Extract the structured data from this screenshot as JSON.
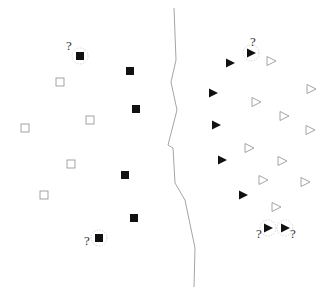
{
  "diagram": {
    "type": "classification-boundary-illustration",
    "colors": {
      "filled": "#111111",
      "hollow_stroke": "#9a9a9a",
      "boundary": "#9a9a9a",
      "query_ring": "#cfcfcf",
      "question": "#333333"
    },
    "boundary": {
      "points": [
        [
          174,
          8
        ],
        [
          176,
          60
        ],
        [
          171,
          82
        ],
        [
          177,
          110
        ],
        [
          168,
          145
        ],
        [
          173,
          148
        ],
        [
          175,
          183
        ],
        [
          185,
          200
        ],
        [
          195,
          248
        ],
        [
          194,
          287
        ]
      ]
    },
    "left_class": {
      "shape": "square",
      "filled": [
        {
          "x": 80,
          "y": 56,
          "query": true,
          "label": "?",
          "label_x": 66,
          "label_y": 50
        },
        {
          "x": 130,
          "y": 71
        },
        {
          "x": 136,
          "y": 109
        },
        {
          "x": 125,
          "y": 175
        },
        {
          "x": 134,
          "y": 218
        },
        {
          "x": 99,
          "y": 238,
          "query": true,
          "label": "?",
          "label_x": 84,
          "label_y": 245
        }
      ],
      "hollow": [
        {
          "x": 60,
          "y": 82
        },
        {
          "x": 90,
          "y": 120
        },
        {
          "x": 25,
          "y": 128
        },
        {
          "x": 71,
          "y": 164
        },
        {
          "x": 44,
          "y": 195
        }
      ]
    },
    "right_class": {
      "shape": "triangle-right",
      "filled": [
        {
          "x": 251,
          "y": 53,
          "query": true,
          "label": "?",
          "label_x": 250,
          "label_y": 46
        },
        {
          "x": 230,
          "y": 63
        },
        {
          "x": 213,
          "y": 93
        },
        {
          "x": 216,
          "y": 125
        },
        {
          "x": 222,
          "y": 160
        },
        {
          "x": 243,
          "y": 195
        },
        {
          "x": 268,
          "y": 228,
          "query": true,
          "label": "?",
          "label_x": 256,
          "label_y": 238
        },
        {
          "x": 285,
          "y": 228,
          "query": true,
          "label": "?",
          "label_x": 290,
          "label_y": 238
        }
      ],
      "hollow": [
        {
          "x": 271,
          "y": 61
        },
        {
          "x": 311,
          "y": 89
        },
        {
          "x": 256,
          "y": 102
        },
        {
          "x": 284,
          "y": 116
        },
        {
          "x": 310,
          "y": 130
        },
        {
          "x": 249,
          "y": 148
        },
        {
          "x": 282,
          "y": 161
        },
        {
          "x": 305,
          "y": 182
        },
        {
          "x": 263,
          "y": 180
        },
        {
          "x": 276,
          "y": 207
        }
      ]
    }
  }
}
